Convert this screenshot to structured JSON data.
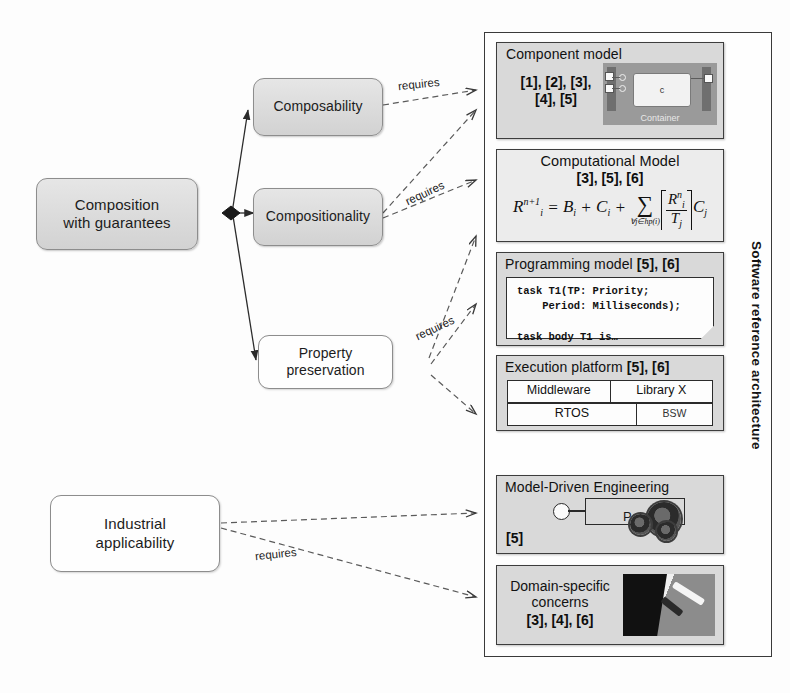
{
  "diagram": {
    "concepts": [
      {
        "id": "composition",
        "label_line1": "Composition",
        "label_line2": "with guarantees"
      },
      {
        "id": "composability",
        "label_line1": "Composability",
        "label_line2": ""
      },
      {
        "id": "compositionality",
        "label_line1": "Compositionality",
        "label_line2": ""
      },
      {
        "id": "property-preservation",
        "label_line1": "Property",
        "label_line2": "preservation"
      },
      {
        "id": "industrial-applicability",
        "label_line1": "Industrial",
        "label_line2": "applicability"
      }
    ],
    "edge_labels": {
      "composability_requires": "requires",
      "compositionality_requires": "requires",
      "property_requires": "requires",
      "industrial_requires": "requires"
    },
    "architecture": {
      "vertical_label": "Software reference architecture",
      "layers": [
        {
          "id": "component-model",
          "title": "Component model",
          "refs": "[1], [2], [3],\n[4], [5]",
          "picture_caption": "Container",
          "picture_component": "c"
        },
        {
          "id": "computational-model",
          "title": "Computational Model",
          "refs": "[3], [5], [6]",
          "formula": {
            "lhs_base": "R",
            "lhs_sub": "i",
            "lhs_sup": "n+1",
            "eq": "=",
            "term_b": "B",
            "term_b_sub": "i",
            "plus1": "+",
            "term_c": "C",
            "term_c_sub": "i",
            "plus2": "+",
            "sigma": "∑",
            "sigma_limit": "∀j∈hp(i)",
            "num_base": "R",
            "num_sub": "i",
            "num_sup": "n",
            "den_base": "T",
            "den_sub": "j",
            "tail": "C",
            "tail_sub": "j",
            "plain": "R_i^{n+1} = B_i + C_i + ∑_{∀j∈hp(i)} ⌈R_i^n / T_j⌉ C_j"
          }
        },
        {
          "id": "programming-model",
          "title": "Programming model ",
          "refs": "[5], [6]",
          "code_line1": "task T1(TP: Priority;",
          "code_line2": "    Period: Milliseconds);",
          "code_line3": "task body T1 is…"
        },
        {
          "id": "execution-platform",
          "title": "Execution platform ",
          "refs": "[5], [6]",
          "row1": [
            "Middleware",
            "Library X"
          ],
          "row2_main": "RTOS",
          "row2_side": "BSW"
        },
        {
          "id": "model-driven-engineering",
          "title": "Model-Driven Engineering",
          "refs": "[5]",
          "picture_label": "P"
        },
        {
          "id": "domain-specific-concerns",
          "title_line1": "Domain-specific",
          "title_line2": "concerns",
          "refs": "[3], [4], [6]"
        }
      ]
    }
  }
}
